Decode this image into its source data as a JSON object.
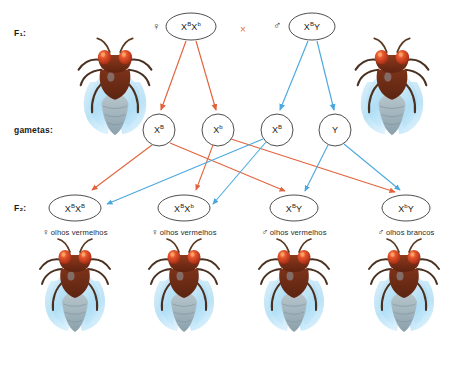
{
  "diagram": {
    "language": "pt-BR",
    "background": "#ffffff",
    "maternal_arrow_color": "#e1633c",
    "paternal_arrow_color": "#4aa8de",
    "cross_symbol_color": "#e0724a",
    "outline_color": "#3a3a3a"
  },
  "rows": {
    "f1_label": "F₁:",
    "gametes_label": "gametas:",
    "f2_label": "F₂:"
  },
  "symbols": {
    "female": "♀",
    "male": "♂",
    "cross": "×"
  },
  "parents": [
    {
      "name": "mother",
      "sex_symbol": "♀",
      "allele1": "X",
      "sup1": "B",
      "allele2": "X",
      "sup2": "b",
      "genotype_text": "XᴮXᵇ"
    },
    {
      "name": "father",
      "sex_symbol": "♂",
      "allele1": "X",
      "sup1": "B",
      "allele2": "Y",
      "sup2": "",
      "genotype_text": "XᴮY"
    }
  ],
  "gametes": [
    {
      "parent": "mother",
      "allele": "X",
      "sup": "B",
      "color": "#e1633c"
    },
    {
      "parent": "mother",
      "allele": "X",
      "sup": "b",
      "color": "#e1633c"
    },
    {
      "parent": "father",
      "allele": "X",
      "sup": "B",
      "color": "#4aa8de"
    },
    {
      "parent": "father",
      "allele": "Y",
      "sup": "",
      "color": "#4aa8de"
    }
  ],
  "offspring": [
    {
      "sex_symbol": "♀",
      "allele1": "X",
      "sup1": "B",
      "allele2": "X",
      "sup2": "B",
      "genotype_text": "XᴮXᴮ",
      "phenotype": "olhos vermelhos",
      "eye_color": "#c0351b"
    },
    {
      "sex_symbol": "♀",
      "allele1": "X",
      "sup1": "B",
      "allele2": "X",
      "sup2": "b",
      "genotype_text": "XᴮXᵇ",
      "phenotype": "olhos vermelhos",
      "eye_color": "#c0351b"
    },
    {
      "sex_symbol": "♂",
      "allele1": "X",
      "sup1": "B",
      "allele2": "Y",
      "sup2": "",
      "genotype_text": "XᴮY",
      "phenotype": "olhos vermelhos",
      "eye_color": "#c0351b"
    },
    {
      "sex_symbol": "♂",
      "allele1": "X",
      "sup1": "b",
      "allele2": "Y",
      "sup2": "",
      "genotype_text": "XᵇY",
      "phenotype": "olhos brancos",
      "eye_color": "#c0351b"
    }
  ]
}
